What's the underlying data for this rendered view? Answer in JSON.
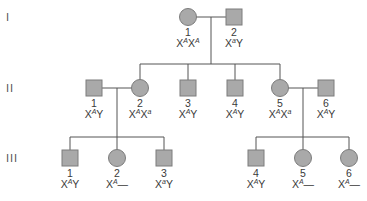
{
  "colors": {
    "symbol_fill": "#a9a9a9",
    "symbol_stroke": "#7c7c7c",
    "line": "#555555",
    "text": "#3a3a3a"
  },
  "generations": [
    {
      "label": "I",
      "y": 17
    },
    {
      "label": "II",
      "y": 88
    },
    {
      "label": "III",
      "y": 158
    }
  ],
  "individuals": [
    {
      "id": "I-1",
      "gen": "I",
      "number": "1",
      "sex": "female",
      "x": 188,
      "y": 17,
      "genotype": {
        "base": "X",
        "allele1": "A",
        "second": "X",
        "allele2": "A"
      },
      "genotype_text": "XAXA"
    },
    {
      "id": "I-2",
      "gen": "I",
      "number": "2",
      "sex": "male",
      "x": 234,
      "y": 17,
      "genotype": {
        "base": "X",
        "allele1": "a",
        "second": "Y",
        "allele2": ""
      },
      "genotype_text": "XaY"
    },
    {
      "id": "II-1",
      "gen": "II",
      "number": "1",
      "sex": "male",
      "x": 94,
      "y": 88,
      "genotype": {
        "base": "X",
        "allele1": "A",
        "second": "Y",
        "allele2": ""
      },
      "genotype_text": "XAY"
    },
    {
      "id": "II-2",
      "gen": "II",
      "number": "2",
      "sex": "female",
      "x": 140,
      "y": 88,
      "genotype": {
        "base": "X",
        "allele1": "A",
        "second": "X",
        "allele2": "a"
      },
      "genotype_text": "XAXa"
    },
    {
      "id": "II-3",
      "gen": "II",
      "number": "3",
      "sex": "male",
      "x": 188,
      "y": 88,
      "genotype": {
        "base": "X",
        "allele1": "A",
        "second": "Y",
        "allele2": ""
      },
      "genotype_text": "XAY"
    },
    {
      "id": "II-4",
      "gen": "II",
      "number": "4",
      "sex": "male",
      "x": 235,
      "y": 88,
      "genotype": {
        "base": "X",
        "allele1": "A",
        "second": "Y",
        "allele2": ""
      },
      "genotype_text": "XAY"
    },
    {
      "id": "II-5",
      "gen": "II",
      "number": "5",
      "sex": "female",
      "x": 280,
      "y": 88,
      "genotype": {
        "base": "X",
        "allele1": "A",
        "second": "X",
        "allele2": "a"
      },
      "genotype_text": "XAXa"
    },
    {
      "id": "II-6",
      "gen": "II",
      "number": "6",
      "sex": "male",
      "x": 326,
      "y": 88,
      "genotype": {
        "base": "X",
        "allele1": "A",
        "second": "Y",
        "allele2": ""
      },
      "genotype_text": "XAY"
    },
    {
      "id": "III-1",
      "gen": "III",
      "number": "1",
      "sex": "male",
      "x": 70,
      "y": 158,
      "genotype": {
        "base": "X",
        "allele1": "A",
        "second": "Y",
        "allele2": ""
      },
      "genotype_text": "XAY"
    },
    {
      "id": "III-2",
      "gen": "III",
      "number": "2",
      "sex": "female",
      "x": 117,
      "y": 158,
      "genotype": {
        "base": "X",
        "allele1": "A",
        "second": "—",
        "allele2": ""
      },
      "genotype_text": "XA—"
    },
    {
      "id": "III-3",
      "gen": "III",
      "number": "3",
      "sex": "male",
      "x": 164,
      "y": 158,
      "genotype": {
        "base": "X",
        "allele1": "a",
        "second": "Y",
        "allele2": ""
      },
      "genotype_text": "XaY"
    },
    {
      "id": "III-4",
      "gen": "III",
      "number": "4",
      "sex": "male",
      "x": 256,
      "y": 158,
      "genotype": {
        "base": "X",
        "allele1": "A",
        "second": "Y",
        "allele2": ""
      },
      "genotype_text": "XAY"
    },
    {
      "id": "III-5",
      "gen": "III",
      "number": "5",
      "sex": "female",
      "x": 303,
      "y": 158,
      "genotype": {
        "base": "X",
        "allele1": "A",
        "second": "—",
        "allele2": ""
      },
      "genotype_text": "XA—"
    },
    {
      "id": "III-6",
      "gen": "III",
      "number": "6",
      "sex": "female",
      "x": 349,
      "y": 158,
      "genotype": {
        "base": "X",
        "allele1": "A",
        "second": "—",
        "allele2": ""
      },
      "genotype_text": "XA—"
    }
  ],
  "matings": [
    {
      "partners": [
        "I-1",
        "I-2"
      ],
      "children": [
        "II-2",
        "II-3",
        "II-4",
        "II-5"
      ]
    },
    {
      "partners": [
        "II-1",
        "II-2"
      ],
      "children": [
        "III-1",
        "III-2",
        "III-3"
      ]
    },
    {
      "partners": [
        "II-5",
        "II-6"
      ],
      "children": [
        "III-4",
        "III-5",
        "III-6"
      ]
    }
  ]
}
